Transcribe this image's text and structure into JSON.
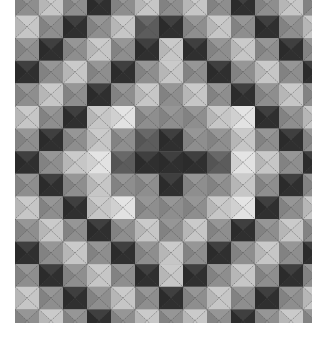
{
  "image": {
    "subject": "black-and-white photograph of a quilt with a checkerboard pattern of gray squares in a diamond/concentric layout",
    "quilting_stitch": "diagonal X stitching across each square"
  },
  "palette": {
    "D": "#2f2f2f",
    "K": "#5c5c5c",
    "M": "#8e8e8e",
    "L": "#c6c6c6",
    "W": "#e2e2e2",
    "background": "#ffffff",
    "stitch": "#4a4a4a"
  },
  "grid": {
    "rows": [
      [
        "M",
        "L",
        "M",
        "D",
        "M",
        "L",
        "M",
        "L",
        "M",
        "D",
        "M",
        "L",
        "M"
      ],
      [
        "L",
        "M",
        "D",
        "M",
        "L",
        "K",
        "D",
        "M",
        "L",
        "M",
        "D",
        "M",
        "L"
      ],
      [
        "M",
        "D",
        "M",
        "L",
        "M",
        "D",
        "L",
        "D",
        "M",
        "L",
        "M",
        "D",
        "M"
      ],
      [
        "D",
        "M",
        "L",
        "M",
        "D",
        "M",
        "L",
        "M",
        "D",
        "M",
        "L",
        "M",
        "D"
      ],
      [
        "M",
        "L",
        "M",
        "D",
        "M",
        "L",
        "M",
        "L",
        "M",
        "D",
        "M",
        "L",
        "M"
      ],
      [
        "L",
        "M",
        "D",
        "L",
        "W",
        "M",
        "M",
        "M",
        "L",
        "W",
        "D",
        "M",
        "L"
      ],
      [
        "M",
        "D",
        "M",
        "L",
        "M",
        "K",
        "D",
        "M",
        "M",
        "L",
        "M",
        "D",
        "M"
      ],
      [
        "D",
        "M",
        "L",
        "W",
        "K",
        "D",
        "D",
        "D",
        "K",
        "W",
        "L",
        "M",
        "D"
      ],
      [
        "M",
        "D",
        "M",
        "L",
        "M",
        "M",
        "D",
        "M",
        "M",
        "L",
        "M",
        "D",
        "M"
      ],
      [
        "L",
        "M",
        "D",
        "L",
        "W",
        "M",
        "M",
        "M",
        "L",
        "W",
        "D",
        "M",
        "L"
      ],
      [
        "M",
        "L",
        "M",
        "D",
        "M",
        "L",
        "M",
        "L",
        "M",
        "D",
        "M",
        "L",
        "M"
      ],
      [
        "D",
        "M",
        "L",
        "M",
        "D",
        "M",
        "L",
        "M",
        "D",
        "M",
        "L",
        "M",
        "D"
      ],
      [
        "M",
        "D",
        "M",
        "L",
        "M",
        "D",
        "L",
        "D",
        "M",
        "L",
        "M",
        "D",
        "M"
      ],
      [
        "L",
        "M",
        "D",
        "M",
        "L",
        "M",
        "D",
        "M",
        "L",
        "M",
        "D",
        "M",
        "L"
      ],
      [
        "M",
        "L",
        "M",
        "D",
        "M",
        "L",
        "M",
        "L",
        "M",
        "D",
        "M",
        "L",
        "M"
      ]
    ]
  }
}
